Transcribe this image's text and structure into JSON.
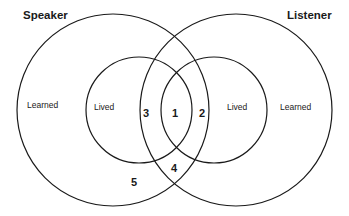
{
  "diagram": {
    "type": "venn",
    "titles": {
      "left": "Speaker",
      "right": "Listener"
    },
    "regions": {
      "left_outer": "Learned",
      "left_inner": "Lived",
      "right_inner": "Lived",
      "right_outer": "Learned"
    },
    "numbers": [
      "1",
      "2",
      "3",
      "4",
      "5"
    ],
    "stroke_color": "#1a1a1a",
    "background": "#ffffff"
  }
}
